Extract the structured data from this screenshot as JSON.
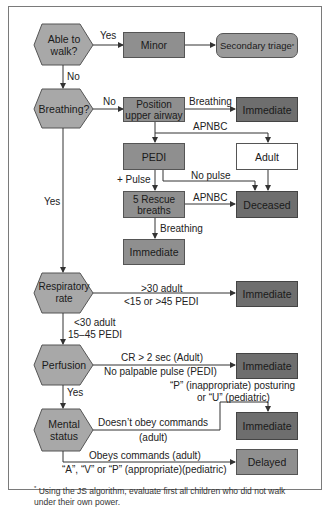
{
  "diagram": {
    "colors": {
      "decision_fill": "#a8a8a8",
      "action_fill": "#8f8f8f",
      "immediate_fill": "#6e6e6e",
      "adult_fill": "#ffffff",
      "line": "#333333",
      "frame": "#7a7a7a"
    },
    "decisions": {
      "walk": "Able to walk?",
      "breathing": "Breathing?",
      "resp_rate": "Respiratory rate",
      "perfusion": "Perfusion",
      "mental": "Mental status"
    },
    "boxes": {
      "minor": "Minor",
      "secondary": "Secondary triage",
      "secondary_mark": "*",
      "position_airway": "Position upper airway",
      "immediate_1": "Immediate",
      "pedi": "PEDI",
      "adult": "Adult",
      "rescue": "5 Rescue breaths",
      "deceased": "Deceased",
      "immediate_2": "Immediate",
      "immediate_3": "Immediate",
      "immediate_4": "Immediate",
      "immediate_5": "Immediate",
      "delayed": "Delayed"
    },
    "edges": {
      "walk_yes": "Yes",
      "walk_no": "No",
      "breathing_no": "No",
      "breathing_yes": "Yes",
      "airway_breathing": "Breathing",
      "apnbc_1": "APNBC",
      "plus_pulse": "+ Pulse",
      "no_pulse": "No pulse",
      "apnbc_2": "APNBC",
      "rescue_breathing": "Breathing",
      "rr_high_1": ">30 adult",
      "rr_high_2": "<15 or >45 PEDI",
      "rr_ok_1": "<30 adult",
      "rr_ok_2": "15–45 PEDI",
      "perf_bad_1": "CR > 2 sec (Adult)",
      "perf_bad_2": "No palpable pulse (PEDI)",
      "perf_yes": "Yes",
      "ped_posture_1": "“P” (inappropriate) posturing",
      "ped_posture_2": "or “U” (pediatric)",
      "no_obey_1": "Doesn’t obey commands",
      "no_obey_2": "(adult)",
      "obey_1": "Obeys commands (adult)",
      "obey_2": "“A”, “V” or “P” (appropriate)(pediatric)"
    },
    "footnote": {
      "mark": "*",
      "text": "Using the JS algorithm, evaluate first all children who did not walk under their own power."
    }
  }
}
